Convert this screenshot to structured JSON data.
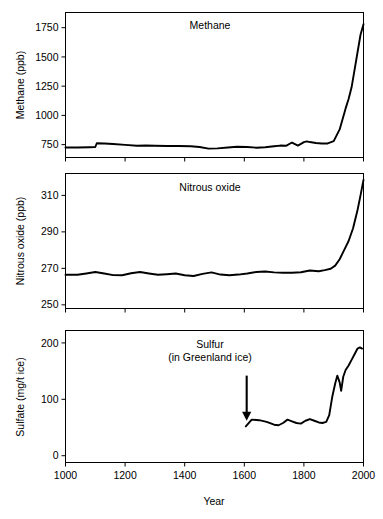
{
  "figure": {
    "background": "#ffffff",
    "line_color": "#000000",
    "axis_color": "#000000"
  },
  "chart_data": [
    {
      "type": "line",
      "panel": "methane",
      "title": "Methane",
      "xlabel": "",
      "ylabel": "Methane (ppb)",
      "xlim": [
        1000,
        2000
      ],
      "ylim": [
        640,
        1880
      ],
      "xticks": [
        1000,
        1200,
        1400,
        1600,
        1800,
        2000
      ],
      "xticklabels": [
        "",
        "",
        "",
        "",
        "",
        ""
      ],
      "yticks": [
        750,
        1000,
        1250,
        1500,
        1750
      ],
      "yticklabels": [
        "750",
        "1000",
        "1250",
        "1500",
        "1750"
      ],
      "grid": false,
      "legend": "none",
      "x": [
        1000,
        1040,
        1080,
        1100,
        1105,
        1130,
        1160,
        1200,
        1240,
        1270,
        1300,
        1340,
        1380,
        1420,
        1450,
        1480,
        1510,
        1545,
        1575,
        1610,
        1640,
        1670,
        1700,
        1720,
        1740,
        1760,
        1780,
        1800,
        1810,
        1820,
        1840,
        1860,
        1880,
        1900,
        1920,
        1940,
        1950,
        1960,
        1970,
        1980,
        1990,
        2000
      ],
      "y": [
        726,
        726,
        728,
        730,
        762,
        760,
        756,
        748,
        740,
        742,
        740,
        738,
        738,
        736,
        730,
        716,
        718,
        726,
        732,
        730,
        724,
        728,
        736,
        742,
        740,
        768,
        742,
        772,
        778,
        772,
        764,
        760,
        760,
        780,
        880,
        1060,
        1140,
        1240,
        1390,
        1540,
        1690,
        1780
      ]
    },
    {
      "type": "line",
      "panel": "nitrous_oxide",
      "title": "Nitrous oxide",
      "xlabel": "",
      "ylabel": "Nitrous oxide (ppb)",
      "xlim": [
        1000,
        2000
      ],
      "ylim": [
        248,
        322
      ],
      "xticks": [
        1000,
        1200,
        1400,
        1600,
        1800,
        2000
      ],
      "xticklabels": [
        "",
        "",
        "",
        "",
        "",
        ""
      ],
      "yticks": [
        250,
        270,
        290,
        310
      ],
      "yticklabels": [
        "250",
        "270",
        "290",
        "310"
      ],
      "grid": false,
      "legend": "none",
      "x": [
        1000,
        1040,
        1070,
        1100,
        1130,
        1160,
        1190,
        1220,
        1250,
        1280,
        1310,
        1340,
        1370,
        1400,
        1430,
        1460,
        1490,
        1520,
        1550,
        1580,
        1610,
        1640,
        1670,
        1700,
        1730,
        1760,
        1790,
        1820,
        1850,
        1870,
        1890,
        1905,
        1920,
        1935,
        1950,
        1965,
        1980,
        1990,
        2000
      ],
      "y": [
        266.5,
        266.5,
        267.2,
        268.0,
        267.2,
        266.3,
        266.2,
        267.3,
        268.0,
        267.2,
        266.5,
        266.8,
        267.2,
        266.2,
        265.8,
        267.0,
        267.8,
        266.6,
        266.2,
        266.6,
        267.2,
        268.0,
        268.3,
        267.8,
        267.6,
        267.6,
        267.9,
        268.8,
        268.4,
        269.0,
        269.8,
        271.5,
        275.0,
        280.0,
        285.0,
        292.0,
        302.0,
        310.0,
        318.5
      ]
    },
    {
      "type": "line",
      "panel": "sulfate",
      "title": "Sulfur",
      "subtitle": "(in Greenland ice)",
      "xlabel": "Year",
      "ylabel": "Sulfate (mg/t ice)",
      "xlim": [
        1000,
        2000
      ],
      "ylim": [
        -12,
        222
      ],
      "xticks": [
        1000,
        1200,
        1400,
        1600,
        1800,
        2000
      ],
      "xticklabels": [
        "1000",
        "1200",
        "1400",
        "1600",
        "1800",
        "2000"
      ],
      "yticks": [
        0,
        100,
        200
      ],
      "yticklabels": [
        "0",
        "100",
        "200"
      ],
      "grid": false,
      "legend": "none",
      "annotation": {
        "type": "arrow",
        "label": "",
        "x": 1608,
        "y_tail": 142,
        "y_head": 62,
        "direction": "down"
      },
      "x": [
        1605,
        1625,
        1650,
        1675,
        1700,
        1715,
        1730,
        1745,
        1760,
        1775,
        1790,
        1805,
        1820,
        1835,
        1850,
        1862,
        1875,
        1885,
        1895,
        1905,
        1912,
        1920,
        1925,
        1932,
        1940,
        1950,
        1960,
        1970,
        1980,
        1988,
        1995
      ],
      "y": [
        52,
        64,
        63,
        60,
        55,
        54,
        58,
        64,
        61,
        58,
        57,
        62,
        65,
        62,
        59,
        58,
        60,
        72,
        104,
        128,
        142,
        130,
        115,
        140,
        152,
        160,
        170,
        180,
        190,
        192,
        190
      ]
    }
  ]
}
